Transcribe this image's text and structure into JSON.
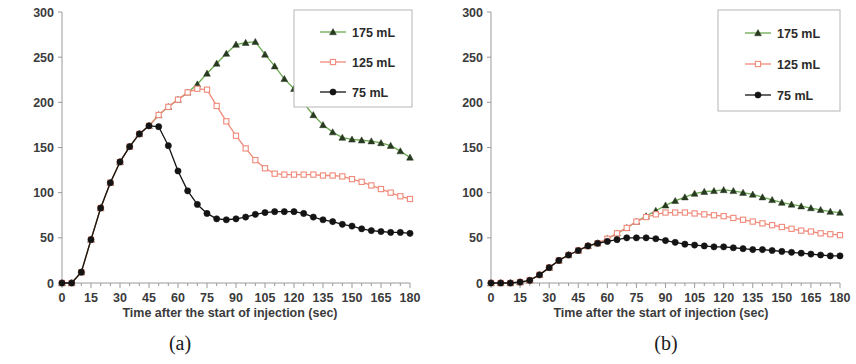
{
  "figure": {
    "panels": [
      {
        "id": "a",
        "caption": "(a)",
        "chart_data": {
          "type": "line",
          "title": "",
          "xlabel": "Time after the start of injection (sec)",
          "ylabel": "Aortic Enhancement (HU)",
          "xlim": [
            0,
            180
          ],
          "ylim": [
            0,
            300
          ],
          "xticks": [
            0,
            15,
            30,
            45,
            60,
            75,
            90,
            105,
            120,
            135,
            150,
            165,
            180
          ],
          "yticks": [
            0,
            50,
            100,
            150,
            200,
            250,
            300
          ],
          "grid": false,
          "legend_position": "top-right",
          "x": [
            0,
            5,
            10,
            15,
            20,
            25,
            30,
            35,
            40,
            45,
            50,
            55,
            60,
            65,
            70,
            75,
            80,
            85,
            90,
            95,
            100,
            105,
            110,
            115,
            120,
            125,
            130,
            135,
            140,
            145,
            150,
            155,
            160,
            165,
            170,
            175,
            180
          ],
          "series": [
            {
              "name": "175 mL",
              "color": "#6aa84f",
              "marker": "triangle",
              "values": [
                0,
                0,
                12,
                48,
                83,
                111,
                134,
                151,
                165,
                174,
                186,
                195,
                203,
                211,
                220,
                232,
                243,
                254,
                264,
                266,
                267,
                253,
                240,
                226,
                215,
                199,
                186,
                175,
                167,
                161,
                159,
                158,
                157,
                155,
                152,
                146,
                139
              ]
            },
            {
              "name": "125 mL",
              "color": "#f08a7a",
              "marker": "square-open",
              "values": [
                0,
                0,
                12,
                48,
                83,
                111,
                134,
                151,
                165,
                174,
                186,
                195,
                203,
                211,
                215,
                214,
                196,
                179,
                163,
                149,
                136,
                127,
                121,
                120,
                120,
                120,
                120,
                119,
                119,
                118,
                115,
                112,
                108,
                104,
                100,
                96,
                93
              ]
            },
            {
              "name": "75 mL",
              "color": "#141414",
              "marker": "circle",
              "values": [
                0,
                0,
                12,
                48,
                83,
                111,
                134,
                151,
                165,
                174,
                173,
                152,
                124,
                102,
                87,
                77,
                71,
                70,
                71,
                73,
                76,
                78,
                79,
                79,
                79,
                77,
                73,
                70,
                68,
                65,
                63,
                60,
                58,
                57,
                56,
                56,
                55
              ]
            }
          ]
        }
      },
      {
        "id": "b",
        "caption": "(b)",
        "chart_data": {
          "type": "line",
          "title": "",
          "xlabel": "Time after the start of injection (sec)",
          "ylabel": "Hepatic Enhancement (HU)",
          "xlim": [
            0,
            180
          ],
          "ylim": [
            0,
            300
          ],
          "xticks": [
            0,
            15,
            30,
            45,
            60,
            75,
            90,
            105,
            120,
            135,
            150,
            165,
            180
          ],
          "yticks": [
            0,
            50,
            100,
            150,
            200,
            250,
            300
          ],
          "grid": false,
          "legend_position": "top-right",
          "x": [
            0,
            5,
            10,
            15,
            20,
            25,
            30,
            35,
            40,
            45,
            50,
            55,
            60,
            65,
            70,
            75,
            80,
            85,
            90,
            95,
            100,
            105,
            110,
            115,
            120,
            125,
            130,
            135,
            140,
            145,
            150,
            155,
            160,
            165,
            170,
            175,
            180
          ],
          "series": [
            {
              "name": "175 mL",
              "color": "#6aa84f",
              "marker": "triangle",
              "values": [
                0,
                0,
                0,
                1,
                3,
                9,
                17,
                25,
                31,
                36,
                41,
                44,
                49,
                55,
                61,
                68,
                74,
                80,
                86,
                91,
                95,
                99,
                101,
                102,
                103,
                102,
                100,
                98,
                95,
                92,
                89,
                87,
                85,
                83,
                81,
                79,
                78
              ]
            },
            {
              "name": "125 mL",
              "color": "#f08a7a",
              "marker": "square-open",
              "values": [
                0,
                0,
                0,
                1,
                3,
                9,
                17,
                25,
                31,
                36,
                41,
                44,
                49,
                55,
                61,
                68,
                73,
                76,
                78,
                78,
                78,
                77,
                76,
                75,
                74,
                72,
                70,
                68,
                66,
                64,
                62,
                60,
                58,
                57,
                55,
                54,
                53
              ]
            },
            {
              "name": "75 mL",
              "color": "#141414",
              "marker": "circle",
              "values": [
                0,
                0,
                0,
                1,
                3,
                9,
                17,
                25,
                31,
                36,
                41,
                44,
                46,
                48,
                50,
                50,
                50,
                49,
                47,
                45,
                43,
                42,
                41,
                40,
                40,
                39,
                38,
                37,
                37,
                36,
                35,
                34,
                33,
                32,
                31,
                30,
                30
              ]
            }
          ]
        }
      }
    ]
  }
}
